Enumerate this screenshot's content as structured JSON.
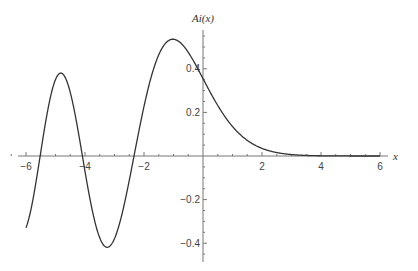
{
  "chart_data": {
    "type": "line",
    "title": "",
    "xlabel": "x",
    "ylabel": "Ai(x)",
    "function": "Airy function Ai(x)",
    "xlim": [
      -6,
      6
    ],
    "ylim": [
      -0.45,
      0.55
    ],
    "grid": false,
    "legend": null,
    "x_ticks": [
      -6,
      -4,
      -2,
      2,
      4,
      6
    ],
    "x_tick_labels": [
      "−6",
      "−4",
      "−2",
      "2",
      "4",
      "6"
    ],
    "y_ticks": [
      0.4,
      0.2,
      -0.2,
      -0.4
    ],
    "y_tick_labels": [
      "0.4",
      "0.2",
      "−0.2",
      "−0.4"
    ],
    "series": [
      {
        "name": "Ai(x)",
        "color": "#333333",
        "x": [
          -6,
          -5.5,
          -5,
          -4.82,
          -4.5,
          -4,
          -3.5,
          -3.25,
          -3,
          -2.5,
          -2.34,
          -2,
          -1.5,
          -1.02,
          -0.5,
          0,
          0.5,
          1,
          1.5,
          2,
          2.5,
          3,
          3.5,
          4,
          5,
          6
        ],
        "values": [
          -0.3292,
          0.1138,
          0.3507,
          0.3788,
          0.3257,
          -0.0702,
          -0.3764,
          -0.419,
          -0.3788,
          -0.1126,
          0.0,
          0.2274,
          0.4642,
          0.5357,
          0.4757,
          0.355,
          0.2317,
          0.1353,
          0.0717,
          0.0349,
          0.0157,
          0.0066,
          0.0025,
          0.001,
          0.0001,
          0.0
        ]
      }
    ],
    "key_points": {
      "zeros": [
        -5.52,
        -4.09,
        -2.34
      ],
      "maxima": [
        {
          "x": -4.82,
          "y": 0.3788
        },
        {
          "x": -1.02,
          "y": 0.5357
        }
      ],
      "minima": [
        {
          "x": -3.25,
          "y": -0.419
        }
      ],
      "y_intercept": 0.355
    }
  },
  "style": {
    "curve_color": "#333333",
    "axis_color": "#777777",
    "background": "#ffffff"
  }
}
